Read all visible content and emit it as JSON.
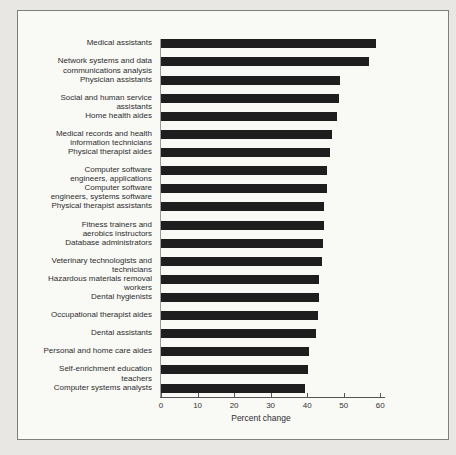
{
  "figure": {
    "xlabel": "Percent change"
  },
  "chart_data": {
    "type": "bar",
    "orientation": "horizontal",
    "title": "",
    "xlabel": "Percent change",
    "ylabel": "",
    "xlim": [
      0,
      60
    ],
    "xticks": [
      0,
      10,
      20,
      30,
      40,
      50,
      60
    ],
    "grid": false,
    "legend": "none",
    "bar_color": "#1e1e1e",
    "panel_color": "#f9f9f6",
    "page_color": "#e8e7e4",
    "rows": [
      {
        "label": "Medical assistants",
        "lines": [
          "Medical assistants"
        ],
        "value": 58.9
      },
      {
        "label": "Network systems and data communications analysis",
        "lines": [
          "Network systems and data",
          "communications analysis"
        ],
        "value": 57.0
      },
      {
        "label": "Physician assistants",
        "lines": [
          "Physician assistants"
        ],
        "value": 48.9
      },
      {
        "label": "Social and human service assistants",
        "lines": [
          "Social and human service",
          "assistants"
        ],
        "value": 48.7
      },
      {
        "label": "Home health aides",
        "lines": [
          "Home health aides"
        ],
        "value": 48.1
      },
      {
        "label": "Medical records and health information technicians",
        "lines": [
          "Medical records and health",
          "information technicians"
        ],
        "value": 46.8
      },
      {
        "label": "Physical therapist aides",
        "lines": [
          "Physical therapist aides"
        ],
        "value": 46.3
      },
      {
        "label": "Computer software engineers, applications",
        "lines": [
          "Computer software",
          "engineers, applications"
        ],
        "value": 45.5
      },
      {
        "label": "Computer software engineers, systems software",
        "lines": [
          "Computer software",
          "engineers, systems software"
        ],
        "value": 45.5
      },
      {
        "label": "Physical therapist assistants",
        "lines": [
          "Physical therapist assistants"
        ],
        "value": 44.6
      },
      {
        "label": "Fitness trainers and aerobics instructors",
        "lines": [
          "Fitness trainers and",
          "aerobics instructors"
        ],
        "value": 44.5
      },
      {
        "label": "Database administrators",
        "lines": [
          "Database administrators"
        ],
        "value": 44.2
      },
      {
        "label": "Veterinary technologists and technicians",
        "lines": [
          "Veterinary technologists and",
          "technicians"
        ],
        "value": 44.1
      },
      {
        "label": "Hazardous materials removal workers",
        "lines": [
          "Hazardous materials removal",
          "workers"
        ],
        "value": 43.1
      },
      {
        "label": "Dental hygienists",
        "lines": [
          "Dental hygienists"
        ],
        "value": 43.1
      },
      {
        "label": "Occupational therapist aides",
        "lines": [
          "Occupational therapist aides"
        ],
        "value": 43.0
      },
      {
        "label": "Dental assistants",
        "lines": [
          "Dental assistants"
        ],
        "value": 42.5
      },
      {
        "label": "Personal and home care aides",
        "lines": [
          "Personal and home care aides"
        ],
        "value": 40.5
      },
      {
        "label": "Self-enrichment education teachers",
        "lines": [
          "Self-enrichment education",
          "teachers"
        ],
        "value": 40.1
      },
      {
        "label": "Computer systems analysts",
        "lines": [
          "Computer systems analysts"
        ],
        "value": 39.4
      }
    ]
  }
}
